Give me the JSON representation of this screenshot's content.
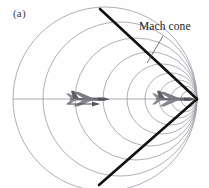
{
  "figure": {
    "panel_label": "(a)",
    "annotation_label": "Mach cone",
    "background_color": "#fefefe",
    "cone_color": "#111111",
    "wave_color": "#9a9aa6",
    "axis_color": "#8c8c94",
    "aircraft_color": "#6a6a72"
  },
  "chart_data": {
    "type": "diagram",
    "title": "Mach cone",
    "subtitle": "(a)",
    "xlabel": "",
    "ylabel": "",
    "apex": {
      "x": 197,
      "y": 99
    },
    "flight_path": {
      "x1": 13,
      "y1": 99,
      "x2": 197,
      "y2": 99
    },
    "cone_lines": [
      {
        "x1": 100,
        "y1": 9,
        "x2": 197,
        "y2": 99
      },
      {
        "x1": 197,
        "y1": 99,
        "x2": 99,
        "y2": 185
      }
    ],
    "wavefronts": [
      {
        "cx": 105,
        "cy": 99,
        "r": 92
      },
      {
        "cx": 120,
        "cy": 99,
        "r": 77
      },
      {
        "cx": 136,
        "cy": 99,
        "r": 61
      },
      {
        "cx": 150,
        "cy": 99,
        "r": 47
      },
      {
        "cx": 162,
        "cy": 99,
        "r": 35
      },
      {
        "cx": 171,
        "cy": 99,
        "r": 26
      },
      {
        "cx": 178,
        "cy": 99,
        "r": 19
      },
      {
        "cx": 184,
        "cy": 99,
        "r": 13
      },
      {
        "cx": 189,
        "cy": 99,
        "r": 8
      }
    ],
    "aircraft": [
      {
        "name": "aircraft-earlier-position",
        "x": 90,
        "y": 97
      },
      {
        "name": "aircraft-current-position",
        "x": 176,
        "y": 97
      }
    ],
    "velocity_arrow": {
      "x1": 68,
      "y1": 104,
      "x2": 100,
      "y2": 104
    },
    "leader_line": {
      "x1": 163,
      "y1": 36,
      "x2": 147,
      "y2": 63
    },
    "legend_position": "none",
    "grid": false
  }
}
